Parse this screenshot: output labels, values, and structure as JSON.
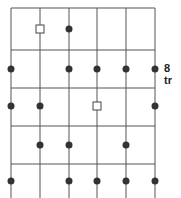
{
  "diagram": {
    "grid": {
      "columns_x": [
        11,
        40,
        69,
        97,
        126,
        155
      ],
      "rows_y": [
        8,
        50,
        88,
        126,
        164
      ],
      "bottom": 198,
      "line_color": "#555555"
    },
    "dot_color": "#333333",
    "rows": [
      {
        "y": 29,
        "dots": [
          2
        ],
        "squares": [
          1
        ]
      },
      {
        "y": 69,
        "dots": [
          0,
          2,
          3,
          4,
          5
        ],
        "squares": [],
        "label": "8 tr"
      },
      {
        "y": 106,
        "dots": [
          0,
          1,
          5
        ],
        "squares": [
          3
        ]
      },
      {
        "y": 145,
        "dots": [
          1,
          2,
          4
        ],
        "squares": []
      },
      {
        "y": 181,
        "dots": [
          0,
          2,
          3,
          4,
          5
        ],
        "squares": []
      }
    ]
  }
}
